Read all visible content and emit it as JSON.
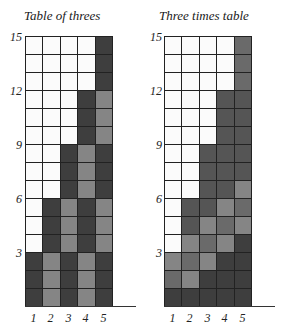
{
  "charts": [
    {
      "title": "Table of threes",
      "y_ticks": [
        "15",
        "12",
        "9",
        "6",
        "3"
      ],
      "x_ticks": [
        "1",
        "2",
        "3",
        "4",
        "5"
      ]
    },
    {
      "title": "Three times table",
      "y_ticks": [
        "15",
        "12",
        "9",
        "6",
        "3"
      ],
      "x_ticks": [
        "1",
        "2",
        "3",
        "4",
        "5"
      ]
    }
  ],
  "colors": {
    "white": "#fbfbfb",
    "dark": "#3e3e3e",
    "mid_dark": "#555555",
    "mid": "#6a6a6a",
    "light": "#858585"
  },
  "chart_data": [
    {
      "type": "table",
      "title": "Table of threes",
      "categories": [
        "1",
        "2",
        "3",
        "4",
        "5"
      ],
      "values": [
        3,
        6,
        9,
        12,
        15
      ],
      "ylim": [
        0,
        15
      ],
      "y_ticks": [
        3,
        6,
        9,
        12,
        15
      ],
      "rows": 15,
      "cols": 5,
      "shading": "groups of 3 alternating dark/light, top group of each column dark"
    },
    {
      "type": "table",
      "title": "Three times table",
      "categories": [
        "1",
        "2",
        "3",
        "4",
        "5"
      ],
      "values": [
        3,
        6,
        9,
        12,
        15
      ],
      "ylim": [
        0,
        15
      ],
      "y_ticks": [
        3,
        6,
        9,
        12,
        15
      ],
      "rows": 15,
      "cols": 5,
      "shading": "three horizontal/diagonal bands of different grey per multiple"
    }
  ]
}
